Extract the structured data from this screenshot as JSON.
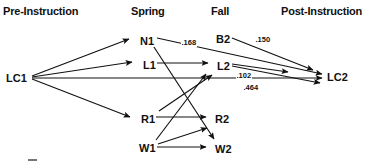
{
  "diagram": {
    "type": "path-diagram",
    "background_color": "#ffffff",
    "ink_color": "#111111",
    "columns": [
      {
        "id": "pre",
        "label": "Pre-Instruction",
        "x": 3,
        "y": 5
      },
      {
        "id": "spring",
        "label": "Spring",
        "x": 131,
        "y": 5
      },
      {
        "id": "fall",
        "label": "Fall",
        "x": 211,
        "y": 5
      },
      {
        "id": "post",
        "label": "Post-Instruction",
        "x": 281,
        "y": 5
      }
    ],
    "nodes": [
      {
        "id": "LC1",
        "label": "LC1",
        "column": "pre",
        "x": 5,
        "y": 72
      },
      {
        "id": "N1",
        "label": "N1",
        "column": "spring",
        "x": 139,
        "y": 35
      },
      {
        "id": "L1",
        "label": "L1",
        "column": "spring",
        "x": 142,
        "y": 59
      },
      {
        "id": "R1",
        "label": "R1",
        "column": "spring",
        "x": 140,
        "y": 113
      },
      {
        "id": "W1",
        "label": "W1",
        "column": "spring",
        "x": 138,
        "y": 142
      },
      {
        "id": "B2",
        "label": "B2",
        "column": "fall",
        "x": 215,
        "y": 33
      },
      {
        "id": "L2",
        "label": "L2",
        "column": "fall",
        "x": 216,
        "y": 60
      },
      {
        "id": "R2",
        "label": "R2",
        "column": "fall",
        "x": 214,
        "y": 113
      },
      {
        "id": "W2",
        "label": "W2",
        "column": "fall",
        "x": 214,
        "y": 143
      },
      {
        "id": "LC2",
        "label": "LC2",
        "column": "post",
        "x": 326,
        "y": 71
      }
    ],
    "edges": [
      {
        "id": "lc1-n1",
        "from": "LC1",
        "to": "N1",
        "coefficient": null
      },
      {
        "id": "lc1-l1",
        "from": "LC1",
        "to": "L1",
        "coefficient": null
      },
      {
        "id": "lc1-r1",
        "from": "LC1",
        "to": "R1",
        "coefficient": null
      },
      {
        "id": "lc1-lc2",
        "from": "LC1",
        "to": "LC2",
        "coefficient": ".464"
      },
      {
        "id": "n1-lc2",
        "from": "N1",
        "to": "LC2",
        "coefficient": ".168"
      },
      {
        "id": "n1-w2",
        "from": "N1",
        "to": "W2",
        "coefficient": null
      },
      {
        "id": "l1-l2",
        "from": "L1",
        "to": "L2",
        "coefficient": null
      },
      {
        "id": "b2-lc2",
        "from": "B2",
        "to": "LC2",
        "coefficient": ".150"
      },
      {
        "id": "l2-lc2",
        "from": "L2",
        "to": "LC2",
        "coefficient": ".102"
      },
      {
        "id": "r1-r2",
        "from": "R1",
        "to": "R2",
        "coefficient": null
      },
      {
        "id": "r1-l2",
        "from": "R1",
        "to": "L2",
        "coefficient": null
      },
      {
        "id": "w1-w2",
        "from": "W1",
        "to": "W2",
        "coefficient": null
      },
      {
        "id": "w1-l2",
        "from": "W1",
        "to": "L2",
        "coefficient": null
      }
    ],
    "coefficient_labels": [
      {
        "id": "coef-168",
        "text": ".168",
        "x": 181,
        "y": 38,
        "edge": "n1-lc2"
      },
      {
        "id": "coef-150",
        "text": ".150",
        "x": 255,
        "y": 35,
        "edge": "b2-lc2"
      },
      {
        "id": "coef-102",
        "text": ".102",
        "x": 236,
        "y": 71,
        "edge": "l2-lc2"
      },
      {
        "id": "coef-464",
        "text": ".464",
        "x": 243,
        "y": 83,
        "edge": "lc1-lc2"
      }
    ]
  }
}
